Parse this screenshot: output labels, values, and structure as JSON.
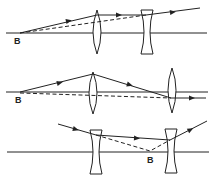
{
  "figure": {
    "type": "ray-optics-diagram",
    "panels": [
      {
        "id": "panel-1",
        "description": "Converging lens followed by diverging lens; ray from point B on axis",
        "point_label": "B",
        "axis_y": 33,
        "axis_x_range": [
          6,
          207
        ],
        "point_B": [
          20,
          33
        ],
        "lenses": [
          {
            "kind": "convex",
            "x": 97,
            "y_top": 10,
            "y_bottom": 54
          },
          {
            "kind": "concave",
            "x": 147,
            "y_top": 10,
            "y_bottom": 54
          }
        ],
        "solid_ray": [
          [
            20,
            33
          ],
          [
            97,
            15
          ],
          [
            146,
            15
          ],
          [
            200,
            8
          ]
        ],
        "dashed_ray": [
          [
            20,
            33
          ],
          [
            146,
            15
          ]
        ],
        "arrows": [
          [
            68,
            21,
            13
          ],
          [
            118,
            15,
            0
          ],
          [
            172,
            12,
            -8
          ]
        ]
      },
      {
        "id": "panel-2",
        "description": "Two converging lenses; ray from B emerges parallel to axis",
        "point_label": "B",
        "axis_y": 92,
        "axis_x_range": [
          6,
          208
        ],
        "point_B": [
          20,
          92
        ],
        "lenses": [
          {
            "kind": "convex",
            "x": 93,
            "y_top": 72,
            "y_bottom": 114
          },
          {
            "kind": "convex",
            "x": 172,
            "y_top": 68,
            "y_bottom": 113
          }
        ],
        "solid_ray": [
          [
            20,
            92
          ],
          [
            93,
            74
          ],
          [
            171,
            98
          ],
          [
            206,
            98
          ]
        ],
        "dashed_ray": [
          [
            20,
            93
          ],
          [
            171,
            98
          ]
        ],
        "arrows": [
          [
            60,
            83,
            -14
          ],
          [
            131,
            85,
            17
          ],
          [
            192,
            98,
            0
          ]
        ]
      },
      {
        "id": "panel-3",
        "description": "Two diverging lenses; virtual point B between them",
        "point_label": "B",
        "axis_y": 152,
        "axis_x_range": [
          7,
          209
        ],
        "point_B": [
          150,
          151
        ],
        "lenses": [
          {
            "kind": "concave",
            "x": 96,
            "y_top": 130,
            "y_bottom": 174
          },
          {
            "kind": "concave",
            "x": 171,
            "y_top": 129,
            "y_bottom": 173
          }
        ],
        "solid_ray": [
          [
            58,
            124
          ],
          [
            96,
            135
          ],
          [
            170,
            140
          ],
          [
            207,
            121
          ]
        ],
        "dashed_ray": [
          [
            96,
            135
          ],
          [
            150,
            151
          ],
          [
            170,
            140
          ]
        ],
        "arrows": [
          [
            76,
            129,
            16
          ],
          [
            137,
            139,
            3
          ],
          [
            191,
            129,
            -28
          ]
        ]
      }
    ]
  }
}
